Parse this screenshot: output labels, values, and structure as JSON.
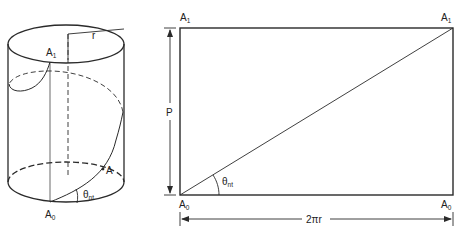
{
  "figure": {
    "type": "helix development diagram",
    "cylinder": {
      "labels": {
        "top_point": "A",
        "top_point_sub": "1",
        "bottom_point": "A",
        "bottom_point_sub": "0",
        "mid_point": "A",
        "radius": "r",
        "angle": "θ",
        "angle_sub": "nt"
      }
    },
    "development": {
      "labels": {
        "top_left": "A",
        "top_left_sub": "1",
        "top_right": "A",
        "top_right_sub": "1",
        "bottom_left": "A",
        "bottom_left_sub": "0",
        "bottom_right": "A",
        "bottom_right_sub": "0",
        "height_dim": "P",
        "width_dim": "2πr",
        "angle": "θ",
        "angle_sub": "nt"
      }
    }
  },
  "colors": {
    "stroke": "#2a2a2a",
    "background": "#ffffff"
  }
}
